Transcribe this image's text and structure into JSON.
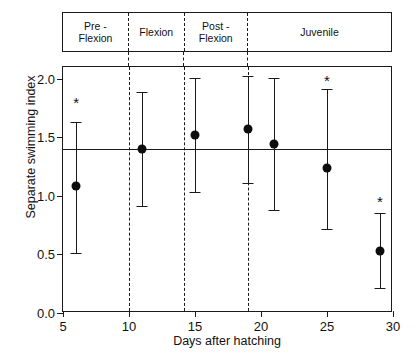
{
  "stage_band": {
    "stages": [
      {
        "label": "Pre -\nFlexion",
        "start_day": 5.0,
        "end_day": 10.0
      },
      {
        "label": "Flexion",
        "start_day": 10.0,
        "end_day": 14.2
      },
      {
        "label": "Post -\nFlexion",
        "start_day": 14.2,
        "end_day": 19.0
      },
      {
        "label": "Juvenile",
        "start_day": 19.0,
        "end_day": 30.0
      }
    ]
  },
  "chart_data": {
    "type": "scatter",
    "title": "",
    "xlabel": "Days after hatching",
    "ylabel": "Separate swimming index",
    "xlim": [
      5,
      30
    ],
    "ylim": [
      0.0,
      2.1
    ],
    "xticks": [
      5,
      10,
      15,
      20,
      25,
      30
    ],
    "xtick_labels": [
      "5",
      "10",
      "15",
      "20",
      "25",
      "30"
    ],
    "yticks": [
      0.0,
      0.5,
      1.0,
      1.5,
      2.0
    ],
    "ytick_labels": [
      "0.0",
      "0.5",
      "1.0",
      "1.5",
      "2.0"
    ],
    "grid": false,
    "legend": "none",
    "reference_line": {
      "y": 1.4,
      "style": "solid",
      "label": ""
    },
    "stage_dividers": [
      10.0,
      14.2,
      19.0
    ],
    "error_bar_type": "range",
    "significance_marker": "*",
    "x": [
      6,
      11,
      15,
      19,
      21,
      25,
      29
    ],
    "values": [
      1.08,
      1.4,
      1.52,
      1.57,
      1.44,
      1.24,
      0.53
    ],
    "err_low": [
      0.51,
      0.91,
      1.03,
      1.11,
      0.88,
      0.72,
      0.21
    ],
    "err_high": [
      1.63,
      1.89,
      2.01,
      2.02,
      2.01,
      1.91,
      0.85
    ],
    "significant": [
      true,
      false,
      false,
      false,
      false,
      true,
      true
    ],
    "points": [
      {
        "day": 6,
        "index": 1.08,
        "low": 0.51,
        "high": 1.63,
        "significant": true,
        "stage": "Pre - Flexion"
      },
      {
        "day": 11,
        "index": 1.4,
        "low": 0.91,
        "high": 1.89,
        "significant": false,
        "stage": "Flexion"
      },
      {
        "day": 15,
        "index": 1.52,
        "low": 1.03,
        "high": 2.01,
        "significant": false,
        "stage": "Post - Flexion"
      },
      {
        "day": 19,
        "index": 1.57,
        "low": 1.11,
        "high": 2.02,
        "significant": false,
        "stage": "Post - Flexion"
      },
      {
        "day": 21,
        "index": 1.44,
        "low": 0.88,
        "high": 2.01,
        "significant": false,
        "stage": "Juvenile"
      },
      {
        "day": 25,
        "index": 1.24,
        "low": 0.72,
        "high": 1.91,
        "significant": true,
        "stage": "Juvenile"
      },
      {
        "day": 29,
        "index": 0.53,
        "low": 0.21,
        "high": 0.85,
        "significant": true,
        "stage": "Juvenile"
      }
    ],
    "star_y": [
      1.8,
      null,
      null,
      null,
      null,
      1.99,
      0.96
    ]
  },
  "colors": {
    "ink": "#1a1a1a",
    "marker": "#0d0d0d",
    "background": "#ffffff"
  }
}
